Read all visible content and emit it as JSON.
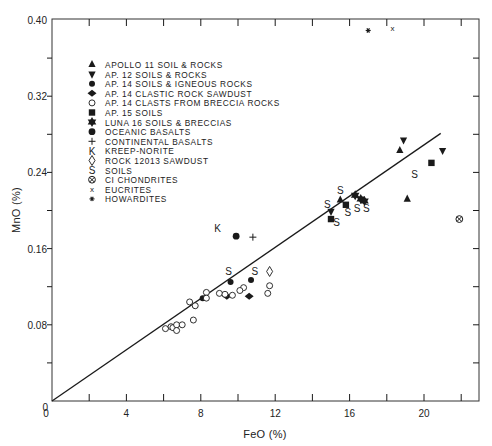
{
  "chart_data": {
    "type": "scatter",
    "title": "",
    "xlabel": "FeO (%)",
    "ylabel": "MnO (%)",
    "xlim": [
      0,
      23
    ],
    "ylim": [
      0,
      0.4
    ],
    "x_ticks": [
      0,
      4,
      8,
      12,
      16,
      20
    ],
    "x_tick_labels": [
      "0",
      "4",
      "8",
      "12",
      "16",
      "20"
    ],
    "x_minor_ticks": [
      2,
      6,
      10,
      14,
      18,
      22
    ],
    "y_ticks": [
      0,
      0.08,
      0.16,
      0.24,
      0.32,
      0.4
    ],
    "y_tick_labels": [
      "0",
      "0.08",
      "0.16",
      "0.24",
      "0.32",
      "0.40"
    ],
    "y_minor_ticks": [
      0.04,
      0.12,
      0.2,
      0.28,
      0.36
    ],
    "grid": false,
    "legend_position": "upper-left inside",
    "fit_line": {
      "x": [
        0,
        20.9
      ],
      "y": [
        0,
        0.281
      ],
      "label": "linear trend through origin"
    },
    "series": [
      {
        "name": "APOLLO 11 SOIL & ROCKS",
        "marker": "triangle-up",
        "points": [
          [
            18.7,
            0.263
          ],
          [
            19.1,
            0.212
          ],
          [
            15.5,
            0.211
          ]
        ]
      },
      {
        "name": "AP. 12 SOILS & ROCKS",
        "marker": "triangle-down",
        "points": [
          [
            18.9,
            0.274
          ],
          [
            21.0,
            0.263
          ],
          [
            15.0,
            0.199
          ]
        ]
      },
      {
        "name": "AP. 14 SOILS & IGNEOUS ROCKS",
        "marker": "circle-filled",
        "points": [
          [
            8.1,
            0.108
          ],
          [
            9.6,
            0.125
          ],
          [
            10.7,
            0.127
          ]
        ]
      },
      {
        "name": "AP. 14 CLASTIC ROCK SAWDUST",
        "marker": "diamond-filled",
        "points": [
          [
            9.4,
            0.11
          ],
          [
            10.6,
            0.11
          ]
        ]
      },
      {
        "name": "AP. 14 CLASTS FROM BRECCIA ROCKS",
        "marker": "circle-open",
        "points": [
          [
            6.1,
            0.076
          ],
          [
            6.4,
            0.078
          ],
          [
            6.5,
            0.077
          ],
          [
            6.7,
            0.08
          ],
          [
            6.7,
            0.074
          ],
          [
            7.0,
            0.08
          ],
          [
            7.4,
            0.104
          ],
          [
            7.7,
            0.1
          ],
          [
            7.6,
            0.085
          ],
          [
            8.3,
            0.114
          ],
          [
            8.3,
            0.108
          ],
          [
            9.0,
            0.113
          ],
          [
            9.7,
            0.111
          ],
          [
            10.3,
            0.119
          ],
          [
            10.1,
            0.116
          ],
          [
            11.6,
            0.113
          ],
          [
            11.7,
            0.121
          ],
          [
            9.3,
            0.112
          ]
        ]
      },
      {
        "name": "AP. 15 SOILS",
        "marker": "square-filled",
        "points": [
          [
            20.4,
            0.25
          ],
          [
            15.0,
            0.191
          ],
          [
            15.8,
            0.206
          ]
        ]
      },
      {
        "name": "LUNA 16 SOILS & BRECCIAS",
        "marker": "star6-filled",
        "points": [
          [
            16.3,
            0.216
          ],
          [
            16.6,
            0.212
          ],
          [
            16.8,
            0.21
          ]
        ]
      },
      {
        "name": "OCEANIC BASALTS",
        "marker": "circle-filled-large",
        "points": [
          [
            9.9,
            0.173
          ]
        ]
      },
      {
        "name": "CONTINENTAL BASALTS",
        "marker": "plus",
        "points": [
          [
            10.8,
            0.172
          ]
        ]
      },
      {
        "name": "KREEP-NORITE",
        "marker": "K",
        "points": [
          [
            8.9,
            0.182
          ]
        ]
      },
      {
        "name": "ROCK 12013 SAWDUST",
        "marker": "diamond-open",
        "points": [
          [
            11.7,
            0.136
          ]
        ]
      },
      {
        "name": "SOILS",
        "marker": "S",
        "points": [
          [
            9.5,
            0.136
          ],
          [
            10.9,
            0.136
          ],
          [
            14.8,
            0.207
          ],
          [
            15.3,
            0.188
          ],
          [
            15.5,
            0.222
          ],
          [
            15.9,
            0.198
          ],
          [
            16.4,
            0.203
          ],
          [
            16.9,
            0.203
          ],
          [
            19.5,
            0.238
          ]
        ]
      },
      {
        "name": "CI CHONDRITES",
        "marker": "circle-cross",
        "points": [
          [
            21.9,
            0.191
          ]
        ]
      },
      {
        "name": "EUCRITES",
        "marker": "x",
        "points": [
          [
            18.3,
            0.392
          ]
        ]
      },
      {
        "name": "HOWARDITES",
        "marker": "asterisk",
        "points": [
          [
            17.0,
            0.389
          ]
        ]
      }
    ]
  },
  "legend": {
    "items": [
      {
        "symbol": "▲",
        "label": "APOLLO 11 SOIL & ROCKS"
      },
      {
        "symbol": "▼",
        "label": "AP. 12 SOILS & ROCKS"
      },
      {
        "symbol": "●",
        "label": "AP. 14 SOILS & IGNEOUS ROCKS"
      },
      {
        "symbol": "◆",
        "label": "AP. 14 CLASTIC ROCK SAWDUST"
      },
      {
        "symbol": "○",
        "label": "AP. 14 CLASTS FROM BRECCIA ROCKS"
      },
      {
        "symbol": "■",
        "label": "AP. 15 SOILS"
      },
      {
        "symbol": "✶",
        "label": "LUNA 16 SOILS & BRECCIAS"
      },
      {
        "symbol": "●",
        "label": "OCEANIC BASALTS"
      },
      {
        "symbol": "+",
        "label": "CONTINENTAL BASALTS"
      },
      {
        "symbol": "K",
        "label": "KREEP-NORITE"
      },
      {
        "symbol": "◊",
        "label": "ROCK 12013 SAWDUST"
      },
      {
        "symbol": "S",
        "label": "SOILS"
      },
      {
        "symbol": "⊗",
        "label": "CI CHONDRITES"
      },
      {
        "symbol": "x",
        "label": "EUCRITES"
      },
      {
        "symbol": "*",
        "label": "HOWARDITES"
      }
    ]
  },
  "colors": {
    "ink": "#1a1a1a",
    "background": "#ffffff",
    "axis": "#333333"
  }
}
